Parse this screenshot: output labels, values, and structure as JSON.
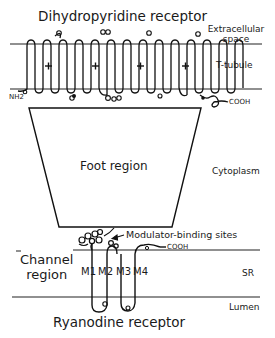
{
  "diagram": {
    "title_top": "Dihydropyridine receptor",
    "title_bottom": "Ryanodine receptor",
    "compartments": {
      "extracellular": "Extracellular space",
      "extracellular_line1": "Extracellular",
      "extracellular_line2": "space",
      "t_tubule": "T-tubule",
      "cytoplasm": "Cytoplasm",
      "sr": "SR",
      "lumen": "Lumen"
    },
    "dhpr": {
      "n_terminus": "NH2",
      "c_terminus": "COOH",
      "domains": 4,
      "helices_per_domain": 6,
      "voltage_sensor_mark": "+"
    },
    "foot_region": "Foot region",
    "ryr": {
      "channel_region_line1": "Channel",
      "channel_region_line2": "region",
      "modulator_label": "Modulator-binding sites",
      "c_terminus": "COOH",
      "segments": [
        "M1",
        "M2",
        "M3",
        "M4"
      ]
    }
  }
}
